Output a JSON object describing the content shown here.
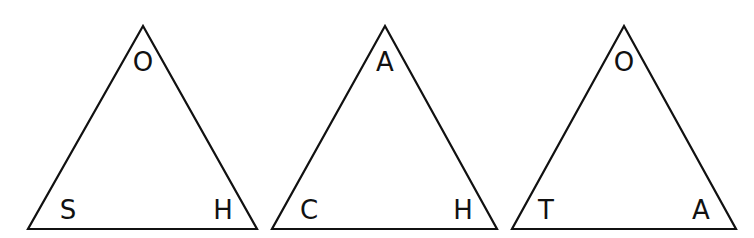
{
  "diagram": {
    "type": "letter-triangles",
    "triangles": [
      {
        "vertices": {
          "top": [
            143,
            26
          ],
          "bottom_left": [
            28,
            229
          ],
          "bottom_right": [
            257,
            229
          ]
        },
        "labels": {
          "top": "O",
          "bottom_left": "S",
          "bottom_right": "H"
        },
        "label_pos": {
          "top": [
            143,
            62
          ],
          "bottom_left": [
            68,
            210
          ],
          "bottom_right": [
            223,
            210
          ]
        }
      },
      {
        "vertices": {
          "top": [
            385,
            26
          ],
          "bottom_left": [
            272,
            229
          ],
          "bottom_right": [
            497,
            229
          ]
        },
        "labels": {
          "top": "A",
          "bottom_left": "C",
          "bottom_right": "H"
        },
        "label_pos": {
          "top": [
            385,
            62
          ],
          "bottom_left": [
            309,
            210
          ],
          "bottom_right": [
            463,
            210
          ]
        }
      },
      {
        "vertices": {
          "top": [
            624,
            26
          ],
          "bottom_left": [
            512,
            229
          ],
          "bottom_right": [
            736,
            229
          ]
        },
        "labels": {
          "top": "O",
          "bottom_left": "T",
          "bottom_right": "A"
        },
        "label_pos": {
          "top": [
            624,
            62
          ],
          "bottom_left": [
            546,
            210
          ],
          "bottom_right": [
            701,
            210
          ]
        }
      }
    ],
    "colors": {
      "stroke": "#111111",
      "text": "#111111",
      "background": "#ffffff"
    }
  }
}
